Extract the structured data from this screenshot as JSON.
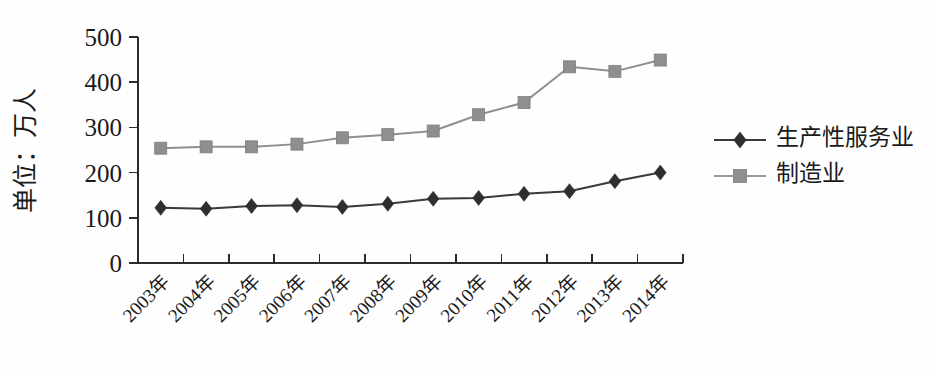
{
  "chart_data": {
    "type": "line",
    "title": "",
    "subtitle": "",
    "xlabel": "",
    "ylabel": "单位：万人",
    "categories": [
      "2003年",
      "2004年",
      "2005年",
      "2006年",
      "2007年",
      "2008年",
      "2009年",
      "2010年",
      "2011年",
      "2012年",
      "2013年",
      "2014年"
    ],
    "series": [
      {
        "name": "生产性服务业",
        "marker": "diamond",
        "color": "#2e2e2e",
        "values": [
          122,
          120,
          126,
          128,
          124,
          131,
          142,
          144,
          153,
          159,
          181,
          200
        ]
      },
      {
        "name": "制造业",
        "marker": "square",
        "color": "#8f8f8f",
        "values": [
          254,
          257,
          257,
          263,
          277,
          284,
          292,
          328,
          355,
          434,
          424,
          449
        ]
      }
    ],
    "ylim": [
      0,
      500
    ],
    "yticks": [
      0,
      100,
      200,
      300,
      400,
      500
    ],
    "ytick_labels": [
      "0",
      "100",
      "200",
      "300",
      "400",
      "500"
    ],
    "grid": false,
    "legend_position": "right",
    "xtick_rotation": 45
  },
  "legend": {
    "items": [
      {
        "label": "生产性服务业",
        "marker": "diamond-marker",
        "color": "#2e2e2e"
      },
      {
        "label": "制造业",
        "marker": "square-marker",
        "color": "#8f8f8f"
      }
    ]
  },
  "geometry": {
    "plot_left": 138,
    "plot_right": 683,
    "plot_top": 37,
    "plot_bottom": 263,
    "legend_x": 714,
    "legend_y": 140,
    "legend_row_gap": 36,
    "legend_marker_half": 26,
    "ylabel_x": 34,
    "ylabel_y": 150
  }
}
